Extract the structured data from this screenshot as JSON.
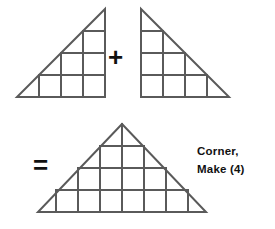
{
  "figure": {
    "line_color": "#5a5a5a",
    "line_width": 2,
    "background": "#ffffff",
    "text_color": "#111111"
  },
  "operators": {
    "plus": "+",
    "equals": "="
  },
  "caption": {
    "line1": "Corner,",
    "line2": "Make (4)",
    "quantity": 4
  },
  "shapes": {
    "left_triangle": {
      "name": "left half-triangle unit",
      "type": "right-triangle",
      "right_angle_corner": "bottom-right",
      "vertices": [
        [
          17,
          97
        ],
        [
          105,
          97
        ],
        [
          105,
          9
        ]
      ],
      "grid_units": 4,
      "squares": 6,
      "half_square_triangles": 4
    },
    "right_triangle": {
      "name": "right half-triangle unit",
      "type": "right-triangle",
      "right_angle_corner": "bottom-left",
      "vertices": [
        [
          141,
          9
        ],
        [
          141,
          97
        ],
        [
          229,
          97
        ]
      ],
      "grid_units": 4,
      "squares": 6,
      "half_square_triangles": 4
    },
    "result_triangle": {
      "name": "assembled corner triangle",
      "type": "isosceles-triangle",
      "vertices": [
        [
          38,
          212
        ],
        [
          206,
          212
        ],
        [
          122,
          124
        ]
      ],
      "grid_units": 4,
      "squares": 12,
      "half_square_triangles": 8
    }
  }
}
